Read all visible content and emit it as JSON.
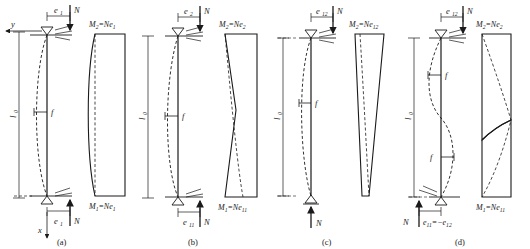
{
  "figure": {
    "type": "structural-engineering-diagram",
    "panels": [
      {
        "id": "a",
        "caption": "(a)",
        "axis_y_label": "y",
        "axis_x_label": "x",
        "length_label": "l",
        "length_sub": "0",
        "deflection_label": "f",
        "top_load_label": "N",
        "bottom_load_label": "N",
        "top_ecc_label": "e",
        "top_ecc_sub": "1",
        "bottom_ecc_label": "e",
        "bottom_ecc_sub": "1",
        "moment_top": "M₂=Ne₁",
        "moment_bottom": "M₁=Ne₁",
        "moment_top_main": "M",
        "moment_top_sub": "2",
        "moment_top_rest": "=Ne",
        "moment_top_rest_sub": "1",
        "moment_bottom_main": "M",
        "moment_bottom_sub": "1",
        "moment_bottom_rest": "=Ne",
        "moment_bottom_rest_sub": "1",
        "diagram_shape": "uniform-bulged-rectangle",
        "curvature": "single"
      },
      {
        "id": "b",
        "caption": "(b)",
        "length_label": "l",
        "length_sub": "0",
        "deflection_label": "f",
        "top_load_label": "N",
        "bottom_load_label": "N",
        "top_ecc_label": "e",
        "top_ecc_sub": "2",
        "bottom_ecc_label": "e",
        "bottom_ecc_sub": "11",
        "moment_top": "M₂=Ne₂",
        "moment_bottom": "M₁=Ne₁₁",
        "moment_top_main": "M",
        "moment_top_sub": "2",
        "moment_top_rest": "=Ne",
        "moment_top_rest_sub": "2",
        "moment_bottom_main": "M",
        "moment_bottom_sub": "1",
        "moment_bottom_rest": "=Ne",
        "moment_bottom_rest_sub": "11",
        "diagram_shape": "tapered-trapezoid",
        "curvature": "single"
      },
      {
        "id": "c",
        "caption": "(c)",
        "length_label": "l",
        "length_sub": "0",
        "deflection_label": "f",
        "top_load_label": "N",
        "bottom_load_label": "N",
        "top_ecc_label": "e",
        "top_ecc_sub": "12",
        "bottom_ecc_label": "",
        "bottom_ecc_sub": "",
        "moment_top": "M₂=Ne₁₂",
        "moment_bottom": "",
        "moment_top_main": "M",
        "moment_top_sub": "2",
        "moment_top_rest": "=Ne",
        "moment_top_rest_sub": "12",
        "moment_bottom_main": "",
        "moment_bottom_sub": "",
        "moment_bottom_rest": "",
        "moment_bottom_rest_sub": "",
        "diagram_shape": "triangle-to-zero",
        "curvature": "single"
      },
      {
        "id": "d",
        "caption": "(d)",
        "length_label": "l",
        "length_sub": "0",
        "deflection_label": "f",
        "deflection_label2": "f",
        "top_load_label": "N",
        "bottom_load_label": "N",
        "top_ecc_label": "e",
        "top_ecc_sub": "12",
        "bottom_ecc_expr": "e₁₁=−e₁₂",
        "bottom_ecc_main": "e",
        "bottom_ecc_sub": "11",
        "bottom_ecc_rest": "=−e",
        "bottom_ecc_rest_sub": "12",
        "moment_top": "M₂=Ne₂",
        "moment_bottom": "M₁=Ne₁₁",
        "moment_top_main": "M",
        "moment_top_sub": "2",
        "moment_top_rest": "=Ne",
        "moment_top_rest_sub": "2",
        "moment_bottom_main": "M",
        "moment_bottom_sub": "1",
        "moment_bottom_rest": "=Ne",
        "moment_bottom_rest_sub": "11",
        "diagram_shape": "double-curvature-s-shape",
        "curvature": "double"
      }
    ],
    "colors": {
      "line": "#1a1a1a",
      "background": "#ffffff",
      "dashed": "#1a1a1a"
    }
  }
}
